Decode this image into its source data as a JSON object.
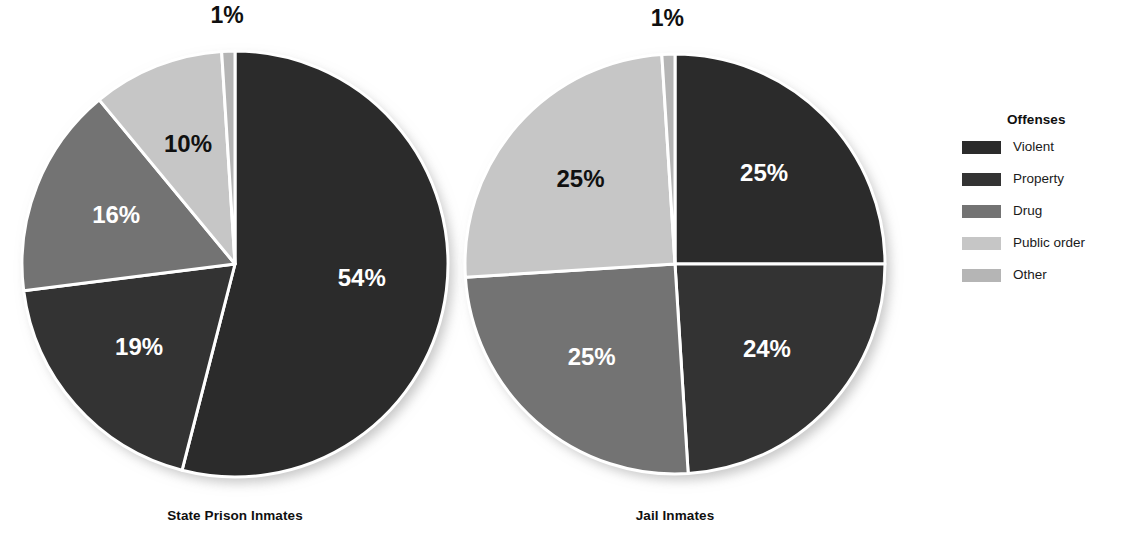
{
  "chart_data": [
    {
      "type": "pie",
      "title": "State Prison Inmates",
      "categories": [
        "Violent",
        "Property",
        "Drug",
        "Public order",
        "Other"
      ],
      "values": [
        54,
        19,
        16,
        10,
        1
      ],
      "labels": [
        "54%",
        "19%",
        "16%",
        "10%",
        "1%"
      ],
      "colors": [
        "#2b2b2b",
        "#333333",
        "#737373",
        "#c6c6c6",
        "#b5b5b5"
      ],
      "label_colors": [
        "#ffffff",
        "#ffffff",
        "#ffffff",
        "#101010",
        "#101010"
      ],
      "start_angle_deg": 0,
      "direction": "clockwise",
      "slice_divider_color": "#ffffff",
      "legend_position": "right"
    },
    {
      "type": "pie",
      "title": "Jail Inmates",
      "categories": [
        "Violent",
        "Property",
        "Drug",
        "Public order",
        "Other"
      ],
      "values": [
        25,
        24,
        25,
        25,
        1
      ],
      "labels": [
        "25%",
        "24%",
        "25%",
        "25%",
        "1%"
      ],
      "colors": [
        "#2b2b2b",
        "#333333",
        "#737373",
        "#c6c6c6",
        "#b5b5b5"
      ],
      "label_colors": [
        "#ffffff",
        "#ffffff",
        "#ffffff",
        "#101010",
        "#101010"
      ],
      "start_angle_deg": 0,
      "direction": "clockwise",
      "slice_divider_color": "#ffffff",
      "legend_position": "right"
    }
  ],
  "charts": {
    "left": {
      "caption": "State Prison Inmates",
      "slices": [
        {
          "name": "Violent",
          "label": "54%",
          "value": 54,
          "color": "#2b2b2b",
          "label_color": "#ffffff"
        },
        {
          "name": "Property",
          "label": "19%",
          "value": 19,
          "color": "#333333",
          "label_color": "#ffffff"
        },
        {
          "name": "Drug",
          "label": "16%",
          "value": 16,
          "color": "#737373",
          "label_color": "#ffffff"
        },
        {
          "name": "Public order",
          "label": "10%",
          "value": 10,
          "color": "#c6c6c6",
          "label_color": "#101010"
        },
        {
          "name": "Other",
          "label": "1%",
          "value": 1,
          "color": "#b5b5b5",
          "label_color": "#101010"
        }
      ]
    },
    "right": {
      "caption": "Jail Inmates",
      "slices": [
        {
          "name": "Violent",
          "label": "25%",
          "value": 25,
          "color": "#2b2b2b",
          "label_color": "#ffffff"
        },
        {
          "name": "Property",
          "label": "24%",
          "value": 24,
          "color": "#333333",
          "label_color": "#ffffff"
        },
        {
          "name": "Drug",
          "label": "25%",
          "value": 25,
          "color": "#737373",
          "label_color": "#ffffff"
        },
        {
          "name": "Public order",
          "label": "25%",
          "value": 25,
          "color": "#c6c6c6",
          "label_color": "#101010"
        },
        {
          "name": "Other",
          "label": "1%",
          "value": 1,
          "color": "#b5b5b5",
          "label_color": "#101010"
        }
      ]
    }
  },
  "legend": {
    "title": "Offenses",
    "items": [
      {
        "label": "Violent",
        "color": "#2b2b2b"
      },
      {
        "label": "Property",
        "color": "#333333"
      },
      {
        "label": "Drug",
        "color": "#737373"
      },
      {
        "label": "Public order",
        "color": "#c6c6c6"
      },
      {
        "label": "Other",
        "color": "#b5b5b5"
      }
    ]
  }
}
